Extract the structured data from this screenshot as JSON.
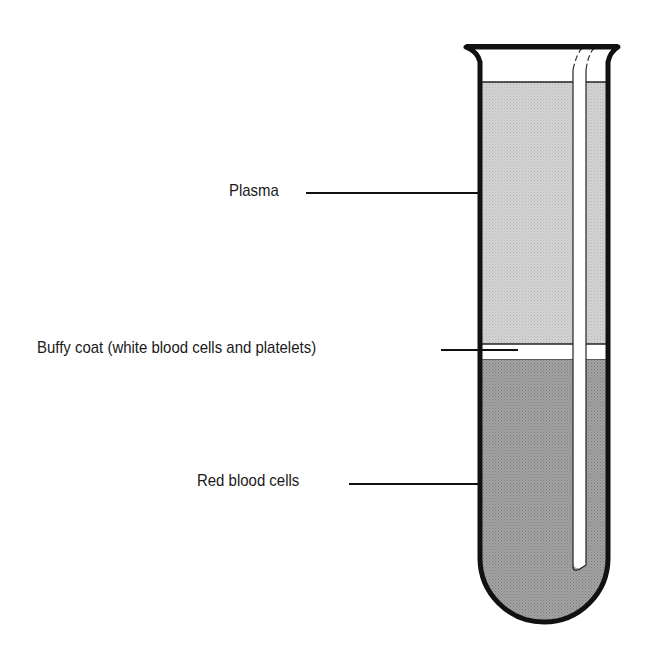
{
  "diagram": {
    "labels": [
      {
        "id": "plasma",
        "text": "Plasma"
      },
      {
        "id": "buffy",
        "text": "Buffy coat (white blood cells and platelets)"
      },
      {
        "id": "rbc",
        "text": "Red blood cells"
      }
    ],
    "colors": {
      "plasma": "#cfcfcf",
      "red_blood_cells": "#9a9a9a",
      "buffy_coat": "#ffffff",
      "outline": "#111111"
    }
  }
}
